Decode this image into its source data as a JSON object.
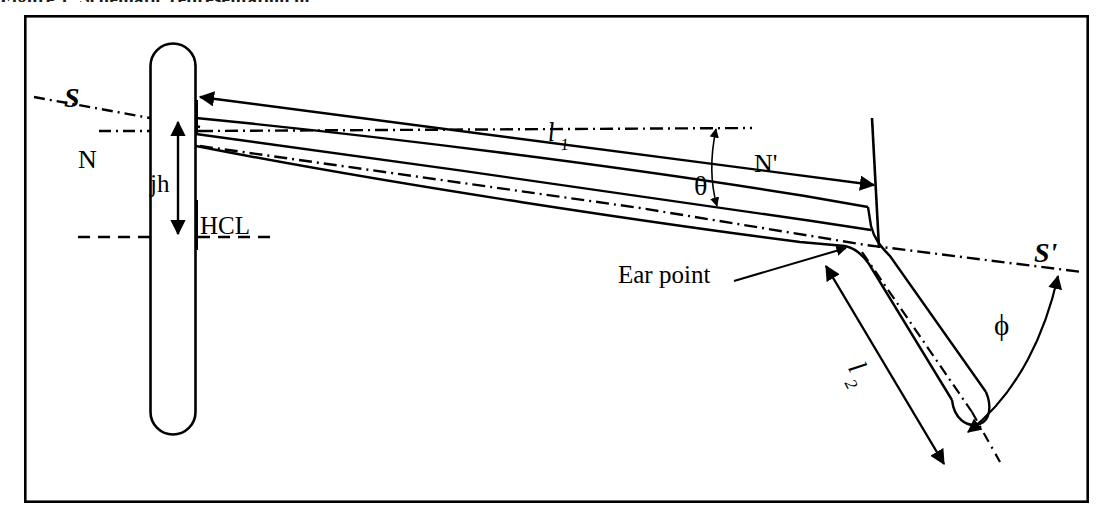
{
  "figure": {
    "domain_kind": "technical-line-diagram",
    "background_color": "#ffffff",
    "ink_color": "#000000",
    "frame_border": {
      "x": 25,
      "y": 16,
      "width": 1063,
      "height": 486,
      "stroke_width": 2.6
    },
    "cut_caption_above": "Figure 1. Schematic representation of"
  },
  "labels": {
    "s": "S",
    "s_prime": "S'",
    "n": "N",
    "n_prime": "N'",
    "jh": "jh",
    "hcl": "HCL",
    "ear_point": "Ear point",
    "l1_base": "l",
    "l1_sub": "1",
    "l2_base": "l",
    "l2_sub": "2",
    "theta": "θ",
    "phi": "ϕ"
  },
  "geometry": {
    "lens_capsule": {
      "name": "lens-rim-capsule",
      "x": 150,
      "y": 43,
      "width": 45,
      "height": 391,
      "corner_radius": 22
    },
    "temple_capsule": {
      "name": "temple-end-capsule",
      "angle_deg": 52,
      "length": 195,
      "width": 46,
      "hinge_x": 880,
      "hinge_y": 248
    },
    "reference_lines": {
      "s_line": {
        "name": "s-sight-line",
        "style": "dash-dot",
        "x1": 35,
        "y1": 98,
        "x2": 196,
        "y2": 126
      },
      "n_line": {
        "name": "n-horizontal-datum",
        "style": "dash-dot",
        "x1": 100,
        "y1": 131,
        "x2": 745,
        "y2": 131
      },
      "n_prime_line": {
        "name": "n-prime-datum",
        "style": "dash-dot",
        "x1": 196,
        "y1": 133,
        "x2": 745,
        "y2": 133
      },
      "s_prime_line": {
        "name": "s-prime-sight-line",
        "style": "dash-dot",
        "x1": 196,
        "y1": 146,
        "x2": 1080,
        "y2": 272
      },
      "hcl_line": {
        "name": "hcl-horizontal-centre-line",
        "style": "dashed",
        "x1": 78,
        "y1": 237,
        "x2": 275,
        "y2": 237
      }
    },
    "dimensions": {
      "jh": {
        "name": "jh-vertical-dimension",
        "x": 178,
        "y_top": 118,
        "y_bottom": 237
      },
      "l1": {
        "name": "l1-temple-length-dimension",
        "x1": 196,
        "y1": 96,
        "x2": 872,
        "y2": 185
      },
      "l2": {
        "name": "l2-drop-length-dimension",
        "x1": 824,
        "y1": 265,
        "x2": 942,
        "y2": 462
      },
      "theta_arrow": {
        "name": "theta-angle-dimension",
        "x": 716,
        "y_top": 128,
        "y_bottom": 205
      },
      "phi_arc": {
        "name": "phi-angle-arc",
        "start_x": 1060,
        "start_y": 275,
        "end_x": 965,
        "end_y": 432
      }
    },
    "label_positions": {
      "s": {
        "x": 68,
        "y": 104
      },
      "n": {
        "x": 82,
        "y": 162
      },
      "n_prime": {
        "x": 757,
        "y": 167
      },
      "s_prime": {
        "x": 1038,
        "y": 257
      },
      "jh": {
        "x": 152,
        "y": 187
      },
      "hcl": {
        "x": 203,
        "y": 228
      },
      "ear_point": {
        "x": 622,
        "y": 276
      },
      "l1": {
        "x": 551,
        "y": 137
      },
      "l2": {
        "x": 852,
        "y": 372
      },
      "theta": {
        "x": 702,
        "y": 186
      },
      "phi": {
        "x": 1001,
        "y": 326
      }
    }
  },
  "font_sizes": {
    "cap_label": 25,
    "small_label": 23,
    "ear_point": 24,
    "greek": 26
  }
}
